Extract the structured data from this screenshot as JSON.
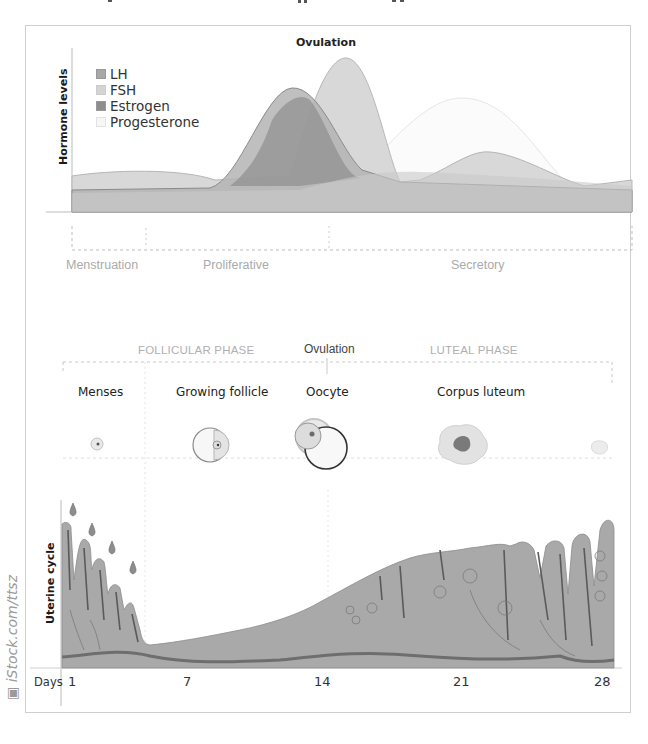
{
  "hormone_chart": {
    "title": "Ovulation",
    "ylabel": "Hormone levels",
    "legend": [
      {
        "name": "LH",
        "color": "#a8a8a8"
      },
      {
        "name": "FSH",
        "color": "#d4d4d4"
      },
      {
        "name": "Estrogen",
        "color": "#8e8e8e"
      },
      {
        "name": "Progesterone",
        "color": "#f6f6f6"
      }
    ],
    "endometrial_phases": [
      "Menstruation",
      "Proliferative",
      "Secretory"
    ]
  },
  "ovarian_cycle": {
    "phases": [
      "FOLLICULAR PHASE",
      "Ovulation",
      "LUTEAL PHASE"
    ],
    "stages": [
      "Menses",
      "Growing follicle",
      "Oocyte",
      "Corpus luteum"
    ]
  },
  "uterine_cycle": {
    "ylabel": "Uterine cycle",
    "xlabel": "Days",
    "day_ticks": [
      "1",
      "7",
      "14",
      "21",
      "28"
    ]
  },
  "watermark": "iStock.com/ttsz",
  "colors": {
    "tissue": "#a9a9a9",
    "tissue_dark": "#6f6f6f",
    "frame": "#cfcfcf",
    "phase_text": "#aaaaaa"
  }
}
